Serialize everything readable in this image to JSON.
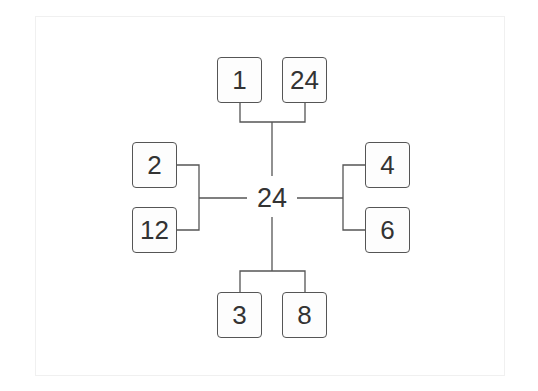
{
  "diagram": {
    "type": "factor-tree",
    "center": {
      "label": "24"
    },
    "branches": [
      {
        "position": "top",
        "factors": [
          "1",
          "24"
        ]
      },
      {
        "position": "left",
        "factors": [
          "2",
          "12"
        ]
      },
      {
        "position": "right",
        "factors": [
          "4",
          "6"
        ]
      },
      {
        "position": "bottom",
        "factors": [
          "3",
          "8"
        ]
      }
    ],
    "colors": {
      "line": "#555555",
      "text": "#333333",
      "box_border": "#555555"
    }
  }
}
